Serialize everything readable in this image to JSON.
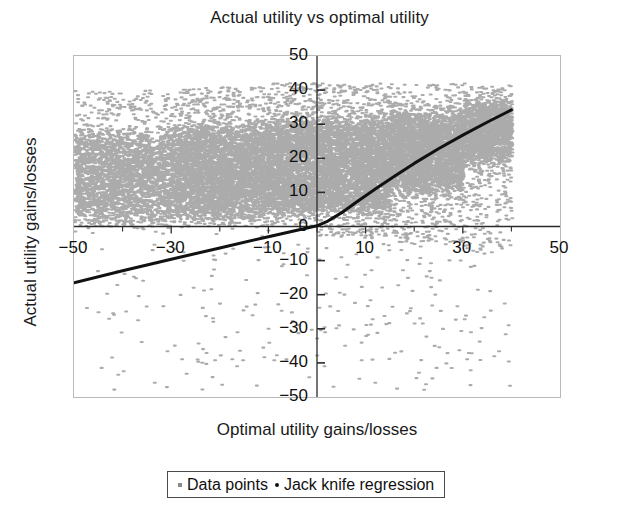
{
  "chart_data": {
    "type": "scatter",
    "title": "Actual utility vs optimal utility",
    "xlabel": "Optimal utility gains/losses",
    "ylabel": "Actual utility gains/losses",
    "xlim": [
      -50,
      50
    ],
    "ylim": [
      -50,
      50
    ],
    "xticks": [
      -50,
      -30,
      -10,
      10,
      30,
      50
    ],
    "xtick_labels": [
      "-50",
      "-30",
      "-10",
      "10",
      "30",
      "50"
    ],
    "yticks": [
      -50,
      -40,
      -30,
      -20,
      -10,
      0,
      10,
      20,
      30,
      40,
      50
    ],
    "ytick_labels": [
      "-50",
      "-40",
      "-30",
      "-20",
      "-10",
      "0",
      "10",
      "20",
      "30",
      "40",
      "50"
    ],
    "minor_xticks": [
      -40,
      -20,
      0,
      20,
      40
    ],
    "grid": false,
    "axes_style": "cross-at-origin",
    "legend_position": "below-plot",
    "series": [
      {
        "name": "Data points",
        "type": "scatter",
        "color": "#8a8a8a",
        "marker": "point",
        "marker_size": 1.6,
        "n_points": 18000,
        "description": "Dense cloud of points. For optimal utility x below 0 the actual utility is concentrated between 0 and 35 with a broad upper scatter; for x above 0 the cloud narrows and tracks a rising band from 0 to about 40. A sparse set of outliers falls below the x-axis down to -50.",
        "density_bands": [
          {
            "x_range": [
              -50,
              -30
            ],
            "y_core": [
              3,
              26
            ],
            "y_spread": [
              0,
              40
            ],
            "weight": 0.6
          },
          {
            "x_range": [
              -30,
              -10
            ],
            "y_core": [
              4,
              28
            ],
            "y_spread": [
              0,
              41
            ],
            "weight": 0.9
          },
          {
            "x_range": [
              -10,
              0
            ],
            "y_core": [
              5,
              30
            ],
            "y_spread": [
              0,
              42
            ],
            "weight": 1.0
          },
          {
            "x_range": [
              0,
              15
            ],
            "y_core": [
              6,
              30
            ],
            "y_spread": [
              -3,
              42
            ],
            "weight": 1.0
          },
          {
            "x_range": [
              15,
              30
            ],
            "y_core": [
              12,
              32
            ],
            "y_spread": [
              -5,
              42
            ],
            "weight": 0.95
          },
          {
            "x_range": [
              30,
              40
            ],
            "y_core": [
              20,
              36
            ],
            "y_spread": [
              -8,
              42
            ],
            "weight": 0.8
          }
        ],
        "outlier_fraction_below_axis": 0.02
      },
      {
        "name": "Jack knife regression",
        "type": "line",
        "color": "#111111",
        "line_width": 3,
        "points": [
          {
            "x": -50,
            "y": -16.5
          },
          {
            "x": -40,
            "y": -13.0
          },
          {
            "x": -30,
            "y": -9.6
          },
          {
            "x": -20,
            "y": -6.3
          },
          {
            "x": -10,
            "y": -3.0
          },
          {
            "x": -5,
            "y": -1.4
          },
          {
            "x": 0,
            "y": 0.2
          },
          {
            "x": 2,
            "y": 1.4
          },
          {
            "x": 5,
            "y": 4.0
          },
          {
            "x": 8,
            "y": 7.0
          },
          {
            "x": 12,
            "y": 11.0
          },
          {
            "x": 16,
            "y": 14.8
          },
          {
            "x": 20,
            "y": 18.5
          },
          {
            "x": 25,
            "y": 22.8
          },
          {
            "x": 30,
            "y": 26.8
          },
          {
            "x": 35,
            "y": 30.6
          },
          {
            "x": 40,
            "y": 34.2
          }
        ]
      }
    ]
  },
  "legend": {
    "items": [
      {
        "label": "Data points",
        "marker": "square-dot"
      },
      {
        "label": "Jack knife regression",
        "marker": "round-dot"
      }
    ]
  },
  "colors": {
    "points": "#8a8a8a",
    "regression": "#111111",
    "frame": "#b9b9b9",
    "axis": "#2b2b2b",
    "text": "#111111"
  }
}
